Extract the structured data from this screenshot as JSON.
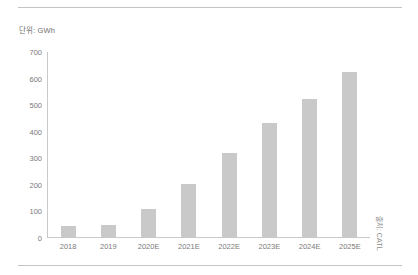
{
  "figure": {
    "unit_caption": "단위: GWh",
    "source_note": "출처: CATL",
    "bar_color": "#c9c9c9",
    "axis_color": "#c9c9c9",
    "rule_color": "#c4c4c4",
    "text_color": "#7a7a7a",
    "background": "#ffffff"
  },
  "chart_data": {
    "type": "bar",
    "title": "단위: GWh",
    "xlabel": "",
    "ylabel": "",
    "ylim": [
      0,
      700
    ],
    "yticks": [
      0,
      100,
      200,
      300,
      400,
      500,
      600,
      700
    ],
    "ytick_labels": [
      "0",
      "100",
      "200",
      "300",
      "400",
      "500",
      "600",
      "700"
    ],
    "grid": false,
    "legend": false,
    "categories": [
      "2018",
      "2019",
      "2020E",
      "2021E",
      "2022E",
      "2023E",
      "2024E",
      "2025E"
    ],
    "values": [
      40,
      45,
      105,
      200,
      315,
      430,
      520,
      620
    ],
    "annotations": [
      "단위: GWh",
      "출처: CATL"
    ]
  }
}
